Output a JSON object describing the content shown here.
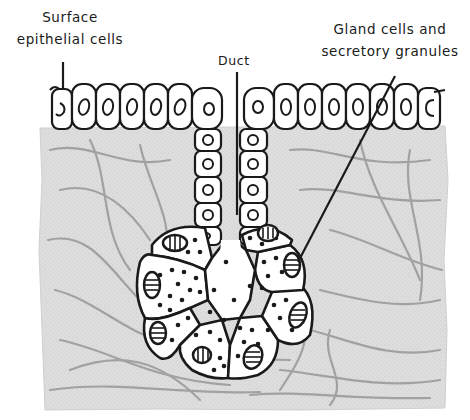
{
  "figure": {
    "colors": {
      "ink": "#1a1a1a",
      "connective_tissue": "#dcdcdc",
      "fibers": "#8a8a8a",
      "cell_fill": "#ffffff"
    }
  },
  "labels": {
    "surface_line1": "Surface",
    "surface_line2": "epithelial cells",
    "duct": "Duct",
    "gland_line1": "Gland cells and",
    "gland_line2": "secretory granules"
  },
  "structures": [
    {
      "name": "surface-epithelium",
      "label": "Surface epithelial cells",
      "count_left": 7,
      "count_right": 8
    },
    {
      "name": "duct",
      "label": "Duct",
      "cells_per_side": 5
    },
    {
      "name": "secretory-acinus",
      "label": "Gland cells and secretory granules",
      "gland_cells": 9
    }
  ]
}
